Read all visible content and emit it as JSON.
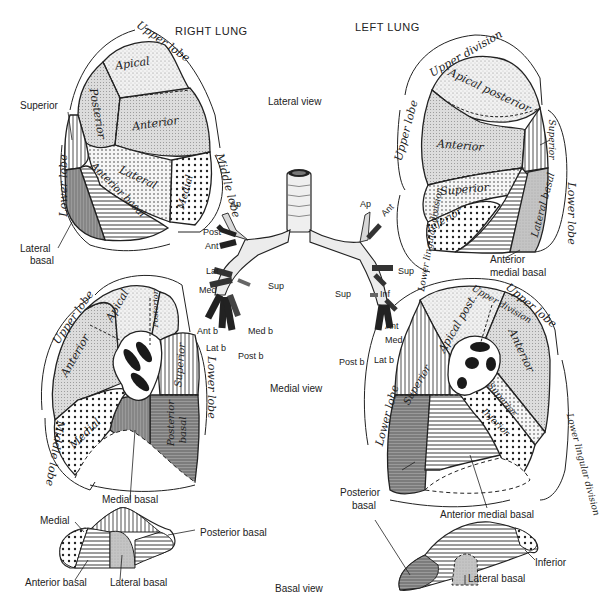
{
  "headings": {
    "right_lung": "RIGHT LUNG",
    "left_lung": "LEFT LUNG"
  },
  "views": {
    "lateral": "Lateral view",
    "medial": "Medial view",
    "basal": "Basal view"
  },
  "right_lateral": {
    "lobes": {
      "upper": "Upper lobe",
      "middle": "Middle lobe",
      "lower": "Lower lobe"
    },
    "segments": {
      "apical": "Apical",
      "posterior": "Posterior",
      "anterior": "Anterior",
      "lateral": "Lateral",
      "medial": "Medial",
      "anterior_basal": "Anterior basal"
    },
    "callouts": {
      "superior": "Superior",
      "lateral_basal_1": "Lateral",
      "lateral_basal_2": "basal"
    }
  },
  "left_lateral": {
    "lobes": {
      "upper": "Upper lobe",
      "upper_division": "Upper division",
      "lower_lingular": "Lower lingular division",
      "lower": "Lower lobe"
    },
    "segments": {
      "apical_posterior": "Apical posterior",
      "anterior": "Anterior",
      "superior_lingular": "Superior",
      "inferior_lingular": "Inferior",
      "lateral_basal": "Lateral basal",
      "superior": "Superior"
    },
    "callouts": {
      "anterior_medial_basal_1": "Anterior",
      "anterior_medial_basal_2": "medial basal"
    }
  },
  "bronchi": {
    "right": [
      "Ap",
      "Post",
      "Ant",
      "Lat",
      "Med",
      "Sup",
      "Ant b",
      "Med b",
      "Lat b",
      "Post b"
    ],
    "left": [
      "Ap",
      "Ant",
      "Sup",
      "Sup",
      "Inf",
      "Ant",
      "Med",
      "Post b",
      "Lat b"
    ]
  },
  "right_medial": {
    "lobes": {
      "upper": "Upper lobe",
      "middle": "Middle lobe",
      "lower": "Lower lobe"
    },
    "segments": {
      "apical": "Apical",
      "posterior": "Posterior",
      "anterior": "Anterior",
      "superior": "Superior",
      "medial": "Medial",
      "posterior_basal_1": "Posterior",
      "posterior_basal_2": "basal"
    },
    "callouts": {
      "medial_basal": "Medial basal"
    }
  },
  "left_medial": {
    "lobes": {
      "upper": "Upper lobe",
      "upper_division": "Upper division",
      "lower": "Lower lobe",
      "lower_lingular": "Lower lingular division"
    },
    "segments": {
      "apical_post": "Apical post.",
      "anterior": "Anterior",
      "superior": "Superior",
      "superior_lingular": "Superior",
      "inferior_lingular": "Inferior"
    },
    "callouts": {
      "posterior_basal_1": "Posterior",
      "posterior_basal_2": "basal",
      "anterior_medial_basal": "Anterior medial basal"
    }
  },
  "right_basal": {
    "callouts": {
      "medial_basal": "Medial basal",
      "medial": "Medial",
      "posterior_basal": "Posterior basal",
      "anterior_basal": "Anterior basal",
      "lateral_basal": "Lateral basal"
    }
  },
  "left_basal": {
    "callouts": {
      "inferior": "Inferior",
      "lateral_basal": "Lateral basal"
    }
  },
  "colors": {
    "ink": "#222222",
    "light_stipple": "#ebebeb",
    "medium_gray": "#c8c8c8",
    "dark_gray": "#8a8a8a",
    "background": "#ffffff"
  }
}
